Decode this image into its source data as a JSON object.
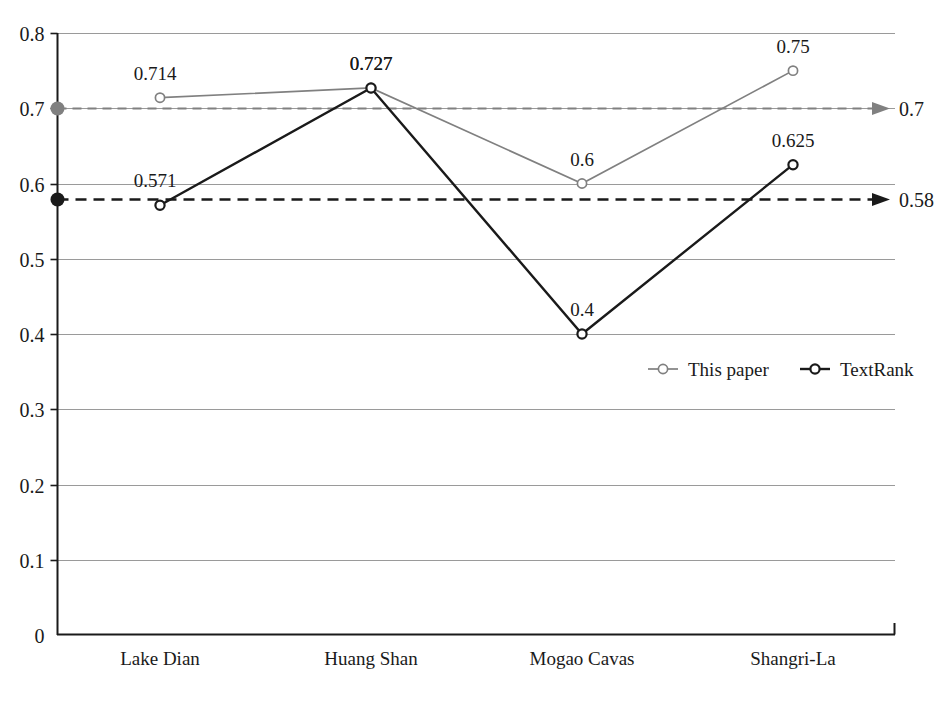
{
  "chart_data": {
    "type": "line",
    "title": "",
    "xlabel": "",
    "ylabel": "",
    "categories": [
      "Lake Dian",
      "Huang Shan",
      "Mogao Cavas",
      "Shangri-La"
    ],
    "ylim": [
      0,
      0.8
    ],
    "yticks": [
      "0",
      "0.1",
      "0.2",
      "0.3",
      "0.4",
      "0.5",
      "0.6",
      "0.7",
      "0.8"
    ],
    "ytick_values": [
      0,
      0.1,
      0.2,
      0.3,
      0.4,
      0.5,
      0.6,
      0.7,
      0.8
    ],
    "grid": true,
    "legend_position": "inside-right-middle",
    "series": [
      {
        "name": "This paper",
        "color": "#808080",
        "marker": "open-circle",
        "values": [
          0.714,
          0.727,
          0.6,
          0.75
        ],
        "labels": [
          "0.714",
          "0.727",
          "0.6",
          "0.75"
        ]
      },
      {
        "name": "TextRank",
        "color": "#1a1a1a",
        "marker": "open-circle",
        "values": [
          0.571,
          0.727,
          0.4,
          0.625
        ],
        "labels": [
          "0.571",
          "0.727",
          "0.4",
          "0.625"
        ]
      }
    ],
    "reference_lines": [
      {
        "name": "this-paper-average",
        "value": 0.7,
        "label": "0.7",
        "color": "#808080",
        "style": "dashed",
        "arrow": true,
        "origin_dot": true
      },
      {
        "name": "textrank-average",
        "value": 0.58,
        "label": "0.58",
        "color": "#1a1a1a",
        "style": "dashed",
        "arrow": true,
        "origin_dot": true
      }
    ]
  },
  "legend": {
    "entries": [
      {
        "label": "This paper",
        "color": "#808080"
      },
      {
        "label": "TextRank",
        "color": "#1a1a1a"
      }
    ]
  },
  "colors": {
    "series_gray": "#808080",
    "series_black": "#1a1a1a",
    "gridline": "#9a9a9a",
    "axis": "#1a1a1a",
    "background": "#ffffff"
  }
}
